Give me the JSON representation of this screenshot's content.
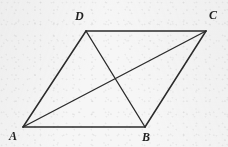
{
  "figure": {
    "kind": "geometry-diagram",
    "shape_name": "parallelogram",
    "canvas": {
      "width": 228,
      "height": 147
    },
    "background_color": "#f6f6f6",
    "stroke_color": "#2b2b2b",
    "label_color": "#1f1f1f",
    "vertices": [
      {
        "id": "A",
        "label": "A",
        "x": 23,
        "y": 127,
        "label_x": 9,
        "label_y": 130
      },
      {
        "id": "B",
        "label": "B",
        "x": 145,
        "y": 127,
        "label_x": 142,
        "label_y": 131
      },
      {
        "id": "C",
        "label": "C",
        "x": 206,
        "y": 31,
        "label_x": 209,
        "label_y": 9
      },
      {
        "id": "D",
        "label": "D",
        "x": 86,
        "y": 31,
        "label_x": 75,
        "label_y": 10
      }
    ],
    "edges": [
      {
        "id": "AB",
        "from": "A",
        "to": "B",
        "type": "side"
      },
      {
        "id": "BC",
        "from": "B",
        "to": "C",
        "type": "side"
      },
      {
        "id": "CD",
        "from": "C",
        "to": "D",
        "type": "side"
      },
      {
        "id": "DA",
        "from": "D",
        "to": "A",
        "type": "side"
      }
    ],
    "diagonals": [
      {
        "id": "AC",
        "from": "A",
        "to": "C",
        "type": "diagonal"
      },
      {
        "id": "DB",
        "from": "D",
        "to": "B",
        "type": "diagonal"
      }
    ],
    "intersection": {
      "id": "O",
      "label": "",
      "x": 115,
      "y": 79
    }
  }
}
